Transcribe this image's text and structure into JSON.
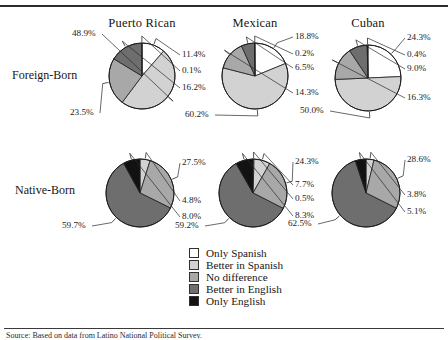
{
  "figure": {
    "row_labels": [
      "Foreign-Born",
      "Native-Born"
    ],
    "column_headers": [
      "Puerto Rican",
      "Mexican",
      "Cuban"
    ],
    "caption": "Source: Based on data from Latino National Political Survey."
  },
  "legend": {
    "items": [
      {
        "label": "Only Spanish",
        "color": "#ffffff"
      },
      {
        "label": "Better in Spanish",
        "color": "#d2d2d2"
      },
      {
        "label": "No difference",
        "color": "#a8a8a8"
      },
      {
        "label": "Better in English",
        "color": "#6e6e6e"
      },
      {
        "label": "Only English",
        "color": "#121212"
      }
    ]
  },
  "chart_data": {
    "type": "pie",
    "categories": [
      "Only Spanish",
      "Better in Spanish",
      "No difference",
      "Better in English",
      "Only English"
    ],
    "colors": [
      "#ffffff",
      "#d2d2d2",
      "#a8a8a8",
      "#6e6e6e",
      "#121212"
    ],
    "rows": [
      "Foreign-Born",
      "Native-Born"
    ],
    "columns": [
      "Puerto Rican",
      "Mexican",
      "Cuban"
    ],
    "unit": "percent",
    "panels": [
      {
        "row": "Foreign-Born",
        "column": "Puerto Rican",
        "values": [
          11.4,
          48.9,
          23.5,
          16.2,
          0.1
        ],
        "labels": [
          "11.4%",
          "48.9%",
          "23.5%",
          "16.2%",
          "0.1%"
        ]
      },
      {
        "row": "Foreign-Born",
        "column": "Mexican",
        "values": [
          18.8,
          60.2,
          14.3,
          6.5,
          0.2
        ],
        "labels": [
          "18.8%",
          "60.2%",
          "14.3%",
          "6.5%",
          "0.2%"
        ]
      },
      {
        "row": "Foreign-Born",
        "column": "Cuban",
        "values": [
          24.3,
          50.0,
          16.3,
          9.0,
          0.4
        ],
        "labels": [
          "24.3%",
          "50.0%",
          "16.3%",
          "9.0%",
          "0.4%"
        ]
      },
      {
        "row": "Native-Born",
        "column": "Puerto Rican",
        "values": [
          0.0,
          4.8,
          27.5,
          59.7,
          8.0
        ],
        "labels": [
          "",
          "4.8%",
          "27.5%",
          "59.7%",
          "8.0%"
        ]
      },
      {
        "row": "Native-Born",
        "column": "Mexican",
        "values": [
          0.5,
          7.7,
          24.3,
          59.2,
          8.3
        ],
        "labels": [
          "0.5%",
          "7.7%",
          "24.3%",
          "59.2%",
          "8.3%"
        ]
      },
      {
        "row": "Native-Born",
        "column": "Cuban",
        "values": [
          0.0,
          3.8,
          28.6,
          62.5,
          5.1
        ],
        "labels": [
          "",
          "3.8%",
          "28.6%",
          "62.5%",
          "5.1%"
        ]
      }
    ]
  }
}
